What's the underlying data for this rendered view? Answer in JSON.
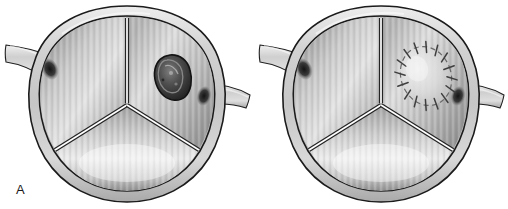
{
  "figure": {
    "background_color": "#ffffff",
    "width": 508,
    "height": 209,
    "panel_count": 2
  },
  "panels": [
    {
      "label": "A",
      "caption": "Aortic valve with irregular dark lesion on right coronary leaflet",
      "anatomy": {
        "structure": "aortic-valve-en-face",
        "wall_label": "aortic wall ring",
        "leaflet_count": 3,
        "leaflets": [
          {
            "name": "left-leaflet",
            "position": "upper-left"
          },
          {
            "name": "right-leaflet",
            "position": "upper-right"
          },
          {
            "name": "non-coronary-leaflet",
            "position": "lower"
          }
        ],
        "commissures": 3,
        "coronary_stubs": [
          {
            "name": "left-coronary-artery-stub",
            "side": "left",
            "angle_deg": 200
          },
          {
            "name": "right-coronary-artery-stub",
            "side": "right",
            "angle_deg": 10
          }
        ],
        "ostia": [
          {
            "name": "left-coronary-ostium",
            "side": "left"
          },
          {
            "name": "right-coronary-ostium",
            "side": "right"
          }
        ]
      },
      "marker": {
        "type": "lesion",
        "name": "valve-lesion",
        "description": "irregular dark nodular mass",
        "leaflet": "right-leaflet",
        "shape": "irregular-oval",
        "fill_color": "#4a4a4a",
        "outline_color": "#1c1c1c",
        "center_x": 170,
        "center_y": 77,
        "radius_x": 17,
        "radius_y": 22
      }
    },
    {
      "label": "B",
      "caption": "Aortic valve after excision and patch repair with interrupted sutures",
      "anatomy": {
        "structure": "aortic-valve-en-face",
        "wall_label": "aortic wall ring",
        "leaflet_count": 3,
        "leaflets": [
          {
            "name": "left-leaflet",
            "position": "upper-left"
          },
          {
            "name": "right-leaflet",
            "position": "upper-right"
          },
          {
            "name": "non-coronary-leaflet",
            "position": "lower"
          }
        ],
        "commissures": 3,
        "coronary_stubs": [
          {
            "name": "left-coronary-artery-stub",
            "side": "left",
            "angle_deg": 200
          },
          {
            "name": "right-coronary-artery-stub",
            "side": "right",
            "angle_deg": 10
          }
        ],
        "ostia": [
          {
            "name": "left-coronary-ostium",
            "side": "left"
          },
          {
            "name": "right-coronary-ostium",
            "side": "right"
          }
        ]
      },
      "marker": {
        "type": "patch-repair",
        "name": "sutured-patch",
        "description": "oval patch secured with interrupted sutures",
        "leaflet": "right-leaflet",
        "shape": "oval",
        "fill_color": "#d8d8d8",
        "outline_color": "#6a6a6a",
        "suture_color": "#4a4a4a",
        "suture_count": 14,
        "center_x": 172,
        "center_y": 76,
        "radius_x": 25,
        "radius_y": 30,
        "rotation_deg": -20
      }
    }
  ],
  "palette": {
    "background": "#ffffff",
    "wall_outline": "#1b1b1b",
    "wall_light": "#e2e2e2",
    "wall_mid": "#c2c2c2",
    "wall_shadow": "#9a9a9a",
    "leaflet_light": "#e6e6e6",
    "leaflet_mid": "#b4b4b4",
    "leaflet_dark": "#8a8a8a",
    "commissure_highlight": "#fdfdfd",
    "commissure_line": "#232323",
    "ostium_dark": "#222222",
    "label_text": "#1a1a1a"
  }
}
